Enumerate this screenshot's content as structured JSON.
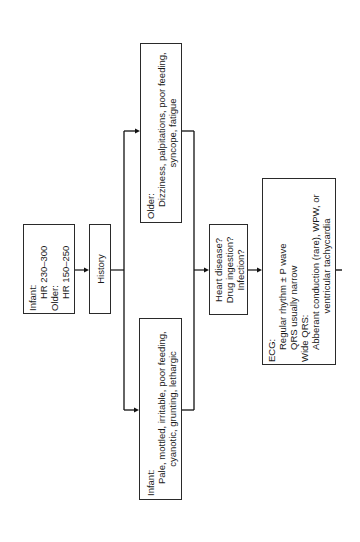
{
  "diagram": {
    "orientation": "rotated-90-ccw",
    "nodes": {
      "hr": {
        "lines": [
          "Infant:",
          "HR 230–300",
          "Older:",
          "HR 150–250"
        ]
      },
      "history": {
        "label": "History"
      },
      "older_symptoms": {
        "heading": "Older:",
        "lines": [
          "Dizziness, palpitations, poor feeding,",
          "syncope, fatigue"
        ]
      },
      "infant_symptoms": {
        "heading": "Infant:",
        "lines": [
          "Pale, mottled, irritable, poor feeding,",
          "cyanotic, grunting, lethargic"
        ]
      },
      "causes": {
        "lines": [
          "Heart disease?",
          "Drug ingestion?",
          "Infection?"
        ]
      },
      "ecg": {
        "heading": "ECG:",
        "lines": [
          "Regular rhythm ± P wave",
          "QRS usually narrow"
        ],
        "heading2": "Wide QRS:",
        "lines2": [
          "Abberant conduction (rare), WPW, or",
          "ventricular tachycardia"
        ]
      }
    },
    "edges": [
      {
        "from": "hr",
        "to": "history"
      },
      {
        "from": "history",
        "to": "older_symptoms"
      },
      {
        "from": "history",
        "to": "infant_symptoms"
      },
      {
        "from": "older_symptoms",
        "to": "causes"
      },
      {
        "from": "infant_symptoms",
        "to": "causes"
      },
      {
        "from": "causes",
        "to": "ecg"
      },
      {
        "from": "ecg",
        "to": "continuation"
      }
    ],
    "colors": {
      "line": "#111111",
      "box_border": "#2a2a2a",
      "background": "#ffffff"
    }
  }
}
